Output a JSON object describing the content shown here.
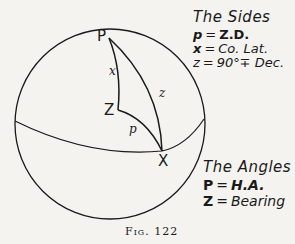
{
  "figure": {
    "caption": "Fig. 122",
    "points": {
      "P": "P",
      "Z": "Z",
      "X": "X"
    },
    "arc_labels": {
      "x": "x",
      "z": "z",
      "p": "p"
    }
  },
  "legend_sides": {
    "title": "The Sides",
    "items": [
      {
        "symbol": "p",
        "eq": "=",
        "value": "Z.D."
      },
      {
        "symbol": "x",
        "eq": "=",
        "value": "Co. Lat."
      },
      {
        "symbol": "z",
        "eq": "=",
        "value": "90°∓ Dec."
      }
    ]
  },
  "legend_angles": {
    "title": "The Angles",
    "items": [
      {
        "symbol": "P",
        "eq": "=",
        "value": "H.A."
      },
      {
        "symbol": "Z",
        "eq": "=",
        "value": "Bearing"
      }
    ]
  },
  "colors": {
    "ink": "#1a1a1a",
    "paper": "#f4f3f0"
  }
}
